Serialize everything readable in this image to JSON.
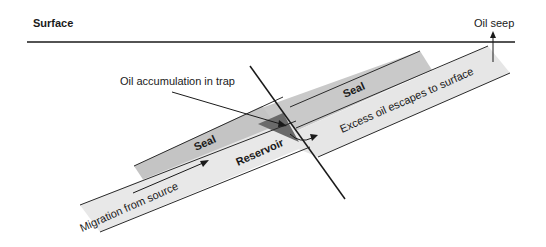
{
  "diagram": {
    "labels": {
      "surface": "Surface",
      "oil_seep": "Oil seep",
      "oil_accumulation": "Oil accumulation in trap",
      "seal_left": "Seal",
      "seal_right": "Seal",
      "reservoir": "Reservoir",
      "migration": "Migration from source",
      "excess_oil": "Excess oil escapes to surface"
    },
    "colors": {
      "background": "#ffffff",
      "seal": "#c8c8c8",
      "reservoir": "#e8e8e8",
      "oil_trap": "#6e6e6e",
      "lines": "#1a1a1a"
    }
  }
}
